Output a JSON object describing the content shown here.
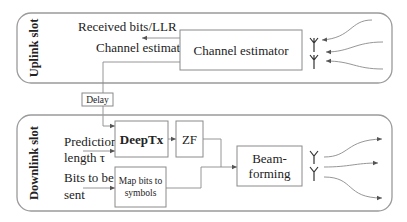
{
  "uplink": {
    "slot_label": "Uplink slot",
    "received_label": "Received bits/LLR",
    "channel_estimate_label": "Channel estimate",
    "channel_estimator": "Channel estimator",
    "antennas": 2,
    "incoming_paths": 3
  },
  "delay": {
    "label": "Delay"
  },
  "downlink": {
    "slot_label": "Downlink slot",
    "prediction_label_line1": "Prediction",
    "prediction_label_line2": "length τ",
    "bits_label_line1": "Bits to be",
    "bits_label_line2": "sent",
    "deeptx": "DeepTx",
    "zf": "ZF",
    "map_bits_line1": "Map bits to",
    "map_bits_line2": "symbols",
    "beamforming_line1": "Beam-",
    "beamforming_line2": "forming",
    "antennas": 2,
    "outgoing_paths": 3
  },
  "colors": {
    "border": "#9a9a9a",
    "wire": "#8a8a8a",
    "text": "#222222"
  }
}
